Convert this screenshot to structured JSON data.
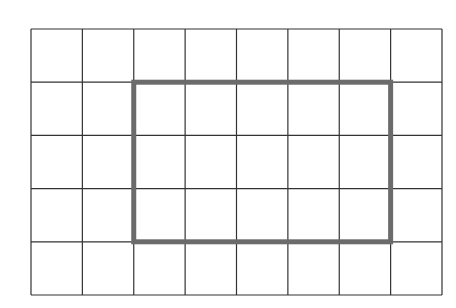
{
  "grid": {
    "columns": 8,
    "rows": 5,
    "left": 31,
    "top": 29,
    "width": 411,
    "height": 266,
    "line_color": "#333333",
    "line_width": 1.2
  },
  "highlight": {
    "col_start": 2,
    "row_start": 1,
    "col_span": 5,
    "row_span": 3,
    "stroke_color": "#6b6b6b",
    "stroke_width": 5
  }
}
